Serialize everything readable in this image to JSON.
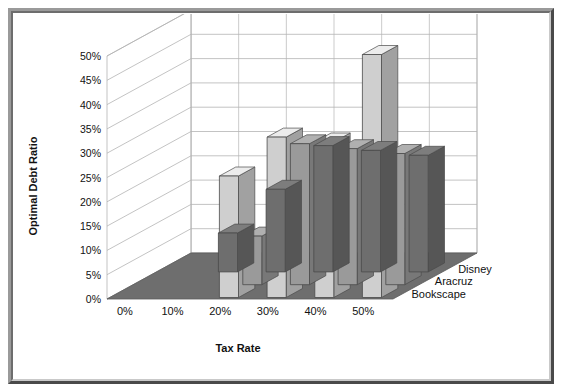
{
  "figure": {
    "frame_style": "beveled-gray-border",
    "background": "#ffffff",
    "border_light": "#9a9a9a",
    "border_dark": "#4a4a4a"
  },
  "chart_data": {
    "type": "bar",
    "subtype": "3d-grouped-bar",
    "title": "",
    "xlabel": "Tax Rate",
    "ylabel": "Optimal Debt Ratio",
    "zlabel": "",
    "categories": [
      "0%",
      "10%",
      "20%",
      "30%",
      "40%",
      "50%"
    ],
    "x_tick_labels": [
      "0%",
      "10%",
      "20%",
      "30%",
      "40%",
      "50%"
    ],
    "y_tick_labels": [
      "0%",
      "5%",
      "10%",
      "15%",
      "20%",
      "25%",
      "30%",
      "35%",
      "40%",
      "45%",
      "50%"
    ],
    "y_ticks": [
      0,
      5,
      10,
      15,
      20,
      25,
      30,
      35,
      40,
      45,
      50
    ],
    "ylim": [
      0,
      50
    ],
    "grid": true,
    "legend_position": "depth-axis-right",
    "series": [
      {
        "name": "Bookscape",
        "color": "#cfcfcf",
        "values": [
          0,
          0,
          25,
          33,
          32,
          50
        ]
      },
      {
        "name": "Aracruz",
        "color": "#9a9a9a",
        "values": [
          0,
          0,
          10,
          29,
          28,
          27
        ]
      },
      {
        "name": "Disney",
        "color": "#6e6e6e",
        "values": [
          0,
          8,
          17,
          26,
          25,
          24
        ]
      }
    ],
    "series_order_back_to_front": [
      "Bookscape",
      "Aracruz",
      "Disney"
    ],
    "colors": {
      "floor": "#6e6e6e",
      "wall": "#ffffff",
      "gridline": "#b4b4b4",
      "bar_edge": "#4a4a4a",
      "text": "#111111"
    }
  }
}
